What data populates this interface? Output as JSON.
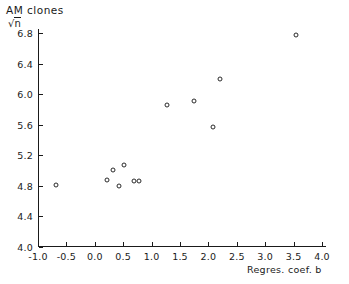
{
  "figure": {
    "title_line1": "AM  clones",
    "title_line2_radical": "√",
    "title_line2_radicand": "n",
    "xlabel": "Regres. coef. b",
    "point_color": "#2a2a2a",
    "axis_color": "#1a1a1a",
    "background": "#ffffff"
  },
  "chart_data": {
    "type": "scatter",
    "title": "AM clones",
    "xlabel": "Regres. coef. b",
    "ylabel": "AM clones / √n",
    "xlim": [
      -1.0,
      4.0
    ],
    "ylim": [
      4.0,
      6.8
    ],
    "xticks": [
      -1.0,
      -0.5,
      0.0,
      0.5,
      1.0,
      1.5,
      2.0,
      2.5,
      3.0,
      3.5,
      4.0
    ],
    "xticklabels": [
      "-1.0",
      "-0.5",
      "0.0",
      "0.5",
      "1.0",
      "1.5",
      "2.0",
      "2.5",
      "3.0",
      "3.5",
      "4.0"
    ],
    "yticks": [
      4.0,
      4.4,
      4.8,
      5.2,
      5.6,
      6.0,
      6.4,
      6.8
    ],
    "yticklabels": [
      "4.0",
      "4.4",
      "4.8",
      "5.2",
      "5.6",
      "6.0",
      "6.4",
      "6.8"
    ],
    "grid": false,
    "legend": false,
    "marker": "open-circle",
    "x": [
      -0.68,
      0.21,
      0.32,
      0.43,
      0.51,
      0.69,
      0.78,
      1.27,
      1.75,
      2.2,
      2.08,
      3.54
    ],
    "y": [
      4.81,
      4.88,
      5.01,
      4.8,
      5.07,
      4.86,
      4.86,
      5.86,
      5.91,
      6.2,
      5.57,
      6.77
    ],
    "points": [
      {
        "x": -0.68,
        "y": 4.81
      },
      {
        "x": 0.21,
        "y": 4.88
      },
      {
        "x": 0.32,
        "y": 5.01
      },
      {
        "x": 0.43,
        "y": 4.8
      },
      {
        "x": 0.51,
        "y": 5.07
      },
      {
        "x": 0.69,
        "y": 4.86
      },
      {
        "x": 0.78,
        "y": 4.86
      },
      {
        "x": 1.27,
        "y": 5.86
      },
      {
        "x": 1.75,
        "y": 5.91
      },
      {
        "x": 2.2,
        "y": 6.2
      },
      {
        "x": 2.08,
        "y": 5.57
      },
      {
        "x": 3.54,
        "y": 6.77
      }
    ]
  }
}
